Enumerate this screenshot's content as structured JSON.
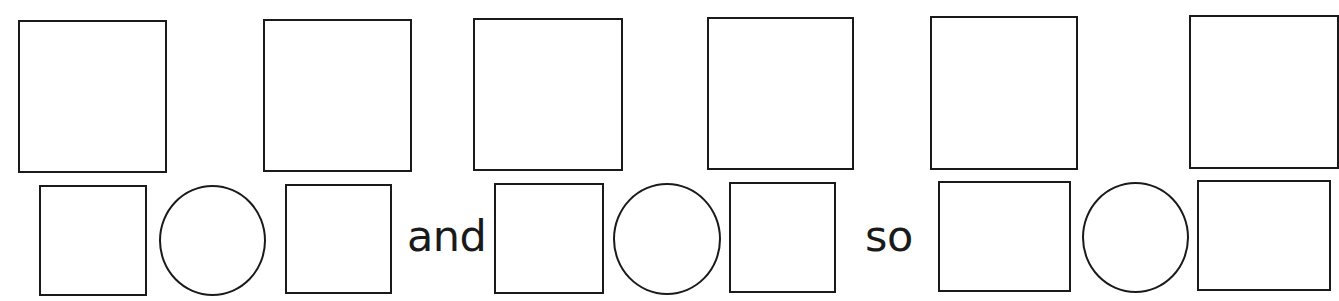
{
  "worksheet": {
    "top_row": {
      "boxes": [
        {
          "id": 1,
          "content": ""
        },
        {
          "id": 2,
          "content": ""
        },
        {
          "id": 3,
          "content": ""
        },
        {
          "id": 4,
          "content": ""
        },
        {
          "id": 5,
          "content": ""
        },
        {
          "id": 6,
          "content": ""
        }
      ]
    },
    "bottom_row": {
      "groups": [
        {
          "left_box": "",
          "operator_circle": "",
          "right_box": ""
        },
        {
          "left_box": "",
          "operator_circle": "",
          "right_box": ""
        },
        {
          "left_box": "",
          "operator_circle": "",
          "right_box": ""
        }
      ],
      "connectors": [
        "and",
        "so"
      ]
    },
    "colors": {
      "stroke": "#1a1a1a",
      "background": "#ffffff"
    }
  }
}
